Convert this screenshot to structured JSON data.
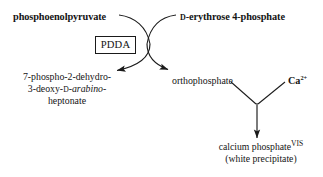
{
  "diagram": {
    "background_color": "#ffffff",
    "line_color": "#1a1a1a",
    "substrates": {
      "left": {
        "text": "phosphoenolpyruvate",
        "style": "bold"
      },
      "right": {
        "prefix": "D",
        "text": "-erythrose 4-phosphate",
        "style": "bold"
      }
    },
    "enzyme": {
      "label": "PDDA",
      "boxed": true
    },
    "products": {
      "left": {
        "line1": "7-phospho-2-dehydro-",
        "line2_a": "3-deoxy-",
        "line2_sc": "D",
        "line2_b": "-",
        "line2_ital": "arabino",
        "line2_c": "-",
        "line3": "heptonate"
      },
      "right": {
        "text": "orthophosphate"
      }
    },
    "reagent": {
      "text": "Ca",
      "charge": "2+",
      "style": "bold"
    },
    "final_product": {
      "line1": "calcium phosphate",
      "line1_sup": "VIS",
      "line2": "(white precipitate)"
    },
    "icons": {
      "arrow_left": "curved-arrow-down-left-icon",
      "arrow_right": "curved-arrow-down-right-icon",
      "arrow_down": "straight-arrow-down-icon"
    }
  }
}
